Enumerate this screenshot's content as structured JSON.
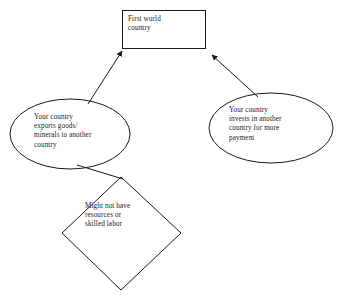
{
  "diagram": {
    "background_color": "#ffffff",
    "stroke_color": "#1a1a1a",
    "text_color": "#1a1a1a",
    "nodes": [
      {
        "id": "first-world-country",
        "shape": "rectangle",
        "text": "First world\ncountry"
      },
      {
        "id": "exports-goods",
        "shape": "ellipse",
        "text": "Your country\nexports goods/\nminerals to another\ncountry"
      },
      {
        "id": "invests-in-another",
        "shape": "ellipse",
        "text": "Your country\ninvests in another\ncountry for more\npayment"
      },
      {
        "id": "might-not-have",
        "shape": "diamond",
        "text": "Might not have\nresources or\nskilled labor"
      }
    ],
    "connectors": [
      {
        "id": "exports-to-first-world",
        "from": "exports-goods",
        "to": "first-world-country",
        "arrowhead": "end"
      },
      {
        "id": "invests-to-first-world",
        "from": "invests-in-another",
        "to": "first-world-country",
        "arrowhead": "end"
      },
      {
        "id": "exports-to-might-not-have",
        "from": "exports-goods",
        "to": "might-not-have",
        "arrowhead": "none"
      }
    ]
  }
}
